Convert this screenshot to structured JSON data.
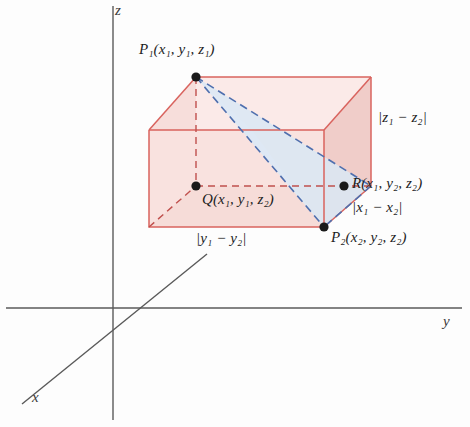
{
  "figure": {
    "background_color": "#fdfdfd"
  },
  "axes": {
    "x_label": "x",
    "y_label": "y",
    "z_label": "z",
    "axis_color": "#5a5a5a",
    "origin": {
      "x": 113,
      "y": 308
    }
  },
  "points": [
    {
      "id": "P1",
      "label": "P₁(x₁, y₁, z₁)",
      "name": "P",
      "name_sub": "1",
      "coords": [
        "x",
        "1",
        "y",
        "1",
        "z",
        "1"
      ],
      "px": 196,
      "py": 77
    },
    {
      "id": "Q",
      "label": "Q(x₁, y₁, z₂)",
      "name": "Q",
      "name_sub": "",
      "coords": [
        "x",
        "1",
        "y",
        "1",
        "z",
        "2"
      ],
      "px": 196,
      "py": 186
    },
    {
      "id": "R",
      "label": "R(x₁, y₂, z₂)",
      "name": "R",
      "name_sub": "",
      "coords": [
        "x",
        "1",
        "y",
        "2",
        "z",
        "2"
      ],
      "px": 344,
      "py": 186
    },
    {
      "id": "P2",
      "label": "P₂(x₂, y₂, z₂)",
      "name": "P",
      "name_sub": "2",
      "coords": [
        "x",
        "2",
        "y",
        "2",
        "z",
        "2"
      ],
      "px": 324,
      "py": 227
    }
  ],
  "edge_labels": [
    {
      "id": "dz",
      "text": "|z₁ − z₂|",
      "var": "z",
      "sub1": "1",
      "sub2": "2",
      "px": 352,
      "py": 112
    },
    {
      "id": "dx",
      "text": "|x₁ − x₂|",
      "var": "x",
      "sub1": "1",
      "sub2": "2",
      "px": 344,
      "py": 199
    },
    {
      "id": "dy",
      "text": "|y₁ − y₂|",
      "var": "y",
      "sub1": "1",
      "sub2": "2",
      "px": 199,
      "py": 230
    }
  ],
  "colors": {
    "box_edge_solid": "#d9635e",
    "box_edge_dashed": "#c0504d",
    "box_face_fill": "#f7dedb",
    "box_face_fill_dark": "#f0cdc9",
    "triangle_stroke": "#4f6fae",
    "triangle_fill": "#d9e7f4",
    "point_fill": "#1a1a1a",
    "axis": "#5a5a5a",
    "text": "#1d1d1d"
  },
  "box": {
    "front_bottom_left": {
      "x": 149,
      "y": 227
    },
    "front_bottom_right": {
      "x": 324,
      "y": 227
    },
    "front_top_left": {
      "x": 149,
      "y": 130
    },
    "front_top_right": {
      "x": 324,
      "y": 130
    },
    "back_bottom_left": {
      "x": 196,
      "y": 186
    },
    "back_bottom_right": {
      "x": 371,
      "y": 186
    },
    "back_top_left": {
      "x": 196,
      "y": 77
    },
    "back_top_right": {
      "x": 371,
      "y": 77
    }
  }
}
